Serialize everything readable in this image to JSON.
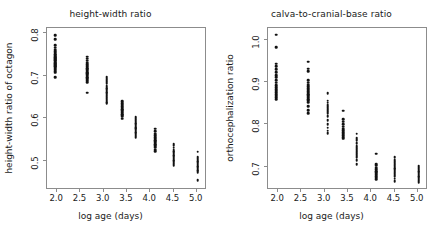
{
  "figure": {
    "background": "#ffffff",
    "point_color": "#111111",
    "frame_color": "#8c8c8c",
    "text_color": "#1a1a1a"
  },
  "chart_data": [
    {
      "type": "scatter",
      "title": "height-width ratio",
      "xlabel": "log age (days)",
      "ylabel": "height-width ratio of octagon",
      "xlim": [
        1.78,
        5.22
      ],
      "ylim": [
        0.432,
        0.812
      ],
      "xticks": [
        2.0,
        2.5,
        3.0,
        3.5,
        4.0,
        4.5,
        5.0
      ],
      "xticklabels": [
        "2.0",
        "2.5",
        "3.0",
        "3.5",
        "4.0",
        "4.5",
        "5.0"
      ],
      "yticks": [
        0.5,
        0.6,
        0.7,
        0.8
      ],
      "yticklabels": [
        "0.5",
        "0.6",
        "0.7",
        "0.8"
      ],
      "grid": false,
      "legend": false,
      "groups": [
        {
          "x": 1.95,
          "y": [
            0.795,
            0.786,
            0.772,
            0.766,
            0.761,
            0.757,
            0.754,
            0.751,
            0.748,
            0.745,
            0.743,
            0.741,
            0.739,
            0.737,
            0.735,
            0.733,
            0.731,
            0.729,
            0.727,
            0.725,
            0.723,
            0.721,
            0.719,
            0.717,
            0.714,
            0.711,
            0.707,
            0.697
          ]
        },
        {
          "x": 2.65,
          "y": [
            0.745,
            0.74,
            0.735,
            0.731,
            0.727,
            0.724,
            0.721,
            0.718,
            0.715,
            0.712,
            0.709,
            0.706,
            0.703,
            0.7,
            0.697,
            0.694,
            0.691,
            0.688,
            0.685,
            0.66
          ]
        },
        {
          "x": 3.06,
          "y": [
            0.697,
            0.693,
            0.689,
            0.685,
            0.681,
            0.677,
            0.674,
            0.671,
            0.668,
            0.665,
            0.662,
            0.659,
            0.656,
            0.652,
            0.648,
            0.644,
            0.641,
            0.638,
            0.635
          ]
        },
        {
          "x": 3.4,
          "y": [
            0.64,
            0.636,
            0.632,
            0.628,
            0.625,
            0.622,
            0.619,
            0.616,
            0.613,
            0.61,
            0.607,
            0.604,
            0.599
          ]
        },
        {
          "x": 3.69,
          "y": [
            0.604,
            0.6,
            0.596,
            0.592,
            0.589,
            0.586,
            0.583,
            0.58,
            0.577,
            0.574,
            0.571,
            0.568,
            0.565,
            0.562,
            0.559,
            0.556
          ]
        },
        {
          "x": 4.1,
          "y": [
            0.576,
            0.57,
            0.564,
            0.56,
            0.556,
            0.552,
            0.549,
            0.546,
            0.543,
            0.54,
            0.537,
            0.534,
            0.531,
            0.527,
            0.523
          ]
        },
        {
          "x": 4.5,
          "y": [
            0.541,
            0.537,
            0.531,
            0.527,
            0.523,
            0.52,
            0.517,
            0.514,
            0.511,
            0.508,
            0.505,
            0.502,
            0.499,
            0.496,
            0.493,
            0.489
          ]
        },
        {
          "x": 5.02,
          "y": [
            0.522,
            0.51,
            0.506,
            0.503,
            0.5,
            0.497,
            0.494,
            0.491,
            0.488,
            0.485,
            0.482,
            0.479,
            0.476,
            0.473,
            0.455
          ]
        }
      ]
    },
    {
      "type": "scatter",
      "title": "calva-to-cranial-base ratio",
      "xlabel": "log age (days)",
      "ylabel": "orthocephalization ratio",
      "xlim": [
        1.78,
        5.22
      ],
      "ylim": [
        0.645,
        1.028
      ],
      "xticks": [
        2.0,
        2.5,
        3.0,
        3.5,
        4.0,
        4.5,
        5.0
      ],
      "xticklabels": [
        "2.0",
        "2.5",
        "3.0",
        "3.5",
        "4.0",
        "4.5",
        "5.0"
      ],
      "yticks": [
        0.7,
        0.8,
        0.9,
        1.0
      ],
      "yticklabels": [
        "0.7",
        "0.8",
        "0.9",
        "1.0"
      ],
      "grid": false,
      "legend": false,
      "groups": [
        {
          "x": 1.95,
          "y": [
            1.012,
            0.983,
            0.944,
            0.937,
            0.93,
            0.923,
            0.917,
            0.911,
            0.905,
            0.899,
            0.893,
            0.888,
            0.884,
            0.88,
            0.876,
            0.872,
            0.868,
            0.864,
            0.86
          ]
        },
        {
          "x": 2.65,
          "y": [
            0.948,
            0.932,
            0.926,
            0.905,
            0.899,
            0.894,
            0.89,
            0.886,
            0.882,
            0.878,
            0.875,
            0.872,
            0.869,
            0.866,
            0.863,
            0.86,
            0.857,
            0.852,
            0.843,
            0.834,
            0.826
          ]
        },
        {
          "x": 3.06,
          "y": [
            0.874,
            0.856,
            0.851,
            0.846,
            0.841,
            0.837,
            0.833,
            0.829,
            0.825,
            0.82,
            0.81,
            0.8,
            0.792,
            0.785,
            0.779
          ]
        },
        {
          "x": 3.4,
          "y": [
            0.832,
            0.812,
            0.806,
            0.8,
            0.795,
            0.79,
            0.786,
            0.782,
            0.778,
            0.774,
            0.77,
            0.766
          ]
        },
        {
          "x": 3.69,
          "y": [
            0.778,
            0.768,
            0.763,
            0.755,
            0.75,
            0.746,
            0.742,
            0.738,
            0.734,
            0.73,
            0.726,
            0.722,
            0.716,
            0.706
          ]
        },
        {
          "x": 4.1,
          "y": [
            0.731,
            0.706,
            0.702,
            0.698,
            0.694,
            0.69,
            0.687,
            0.684,
            0.681,
            0.678,
            0.674,
            0.67
          ]
        },
        {
          "x": 4.5,
          "y": [
            0.722,
            0.716,
            0.711,
            0.707,
            0.703,
            0.7,
            0.697,
            0.694,
            0.691,
            0.688,
            0.685,
            0.681,
            0.677,
            0.672,
            0.666
          ]
        },
        {
          "x": 5.02,
          "y": [
            0.701,
            0.697,
            0.693,
            0.69,
            0.687,
            0.684,
            0.681,
            0.678,
            0.675,
            0.672,
            0.669,
            0.666,
            0.662
          ]
        }
      ]
    }
  ]
}
